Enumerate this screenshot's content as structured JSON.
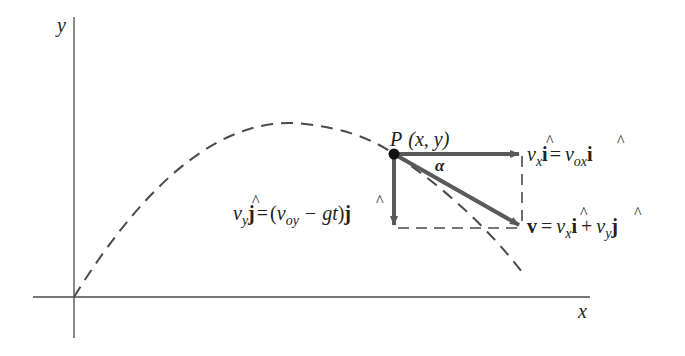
{
  "diagram": {
    "colors": {
      "background": "#ffffff",
      "axis": "#4a4a4a",
      "trajectory": "#4a4a4a",
      "vector": "#5a5a5a",
      "point": "#111111",
      "text": "#222222"
    },
    "axes": {
      "x_label": "x",
      "y_label": "y"
    },
    "point": {
      "label_letter": "P",
      "label_coords": "(x, y)"
    },
    "angle": {
      "label": "α"
    },
    "vectors": {
      "horizontal": {
        "name": "v_x i-hat",
        "lhs_v": "v",
        "lhs_sub": "x",
        "lhs_unit": "i",
        "eq": "=",
        "rhs_v": "v",
        "rhs_sub": "ox",
        "rhs_unit": "i"
      },
      "vertical": {
        "name": "v_y j-hat",
        "lhs_v": "v",
        "lhs_sub": "y",
        "lhs_unit": "j",
        "eq": "=",
        "paren_open": "(",
        "rhs_v": "v",
        "rhs_sub": "oy",
        "minus": "−",
        "gt": "gt",
        "paren_close": ")",
        "rhs_unit": "j"
      },
      "resultant": {
        "name": "v",
        "lhs": "v",
        "eq": "=",
        "t1_v": "v",
        "t1_sub": "x",
        "t1_unit": "i",
        "plus": "+",
        "t2_v": "v",
        "t2_sub": "y",
        "t2_unit": "j"
      }
    },
    "hat": "^"
  }
}
